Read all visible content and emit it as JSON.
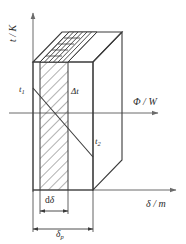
{
  "figure": {
    "type": "technical-diagram",
    "background_color": "#ffffff",
    "line_color": "#3a3a3a",
    "axis_color": "#6b6b6b",
    "hatch_color": "#4a4a4a",
    "width": 186,
    "height": 244
  },
  "axes": {
    "vertical": {
      "name": "temperature-axis",
      "label_symbol": "t",
      "label_unit": "K",
      "label": "t / K",
      "separator": "/"
    },
    "horizontal_flux": {
      "name": "heat-flow-axis",
      "label_symbol": "Φ",
      "label_unit": "W",
      "label": "Φ / W",
      "separator": "/"
    },
    "horizontal_thickness": {
      "name": "thickness-axis",
      "label_symbol": "δ",
      "label_unit": "m",
      "label": "δ / m",
      "separator": "/"
    }
  },
  "labels": {
    "t1": {
      "base": "t",
      "subscript": "1"
    },
    "t2": {
      "base": "t",
      "subscript": "2"
    },
    "delta_t": {
      "text": "Δt"
    },
    "d_delta": {
      "prefix": "d",
      "symbol": "δ"
    },
    "delta_p": {
      "base": "δ",
      "subscript": "p"
    }
  },
  "dimensions": [
    {
      "name": "element-thickness",
      "label": "dδ"
    },
    {
      "name": "wall-thickness",
      "label": "δp"
    }
  ]
}
